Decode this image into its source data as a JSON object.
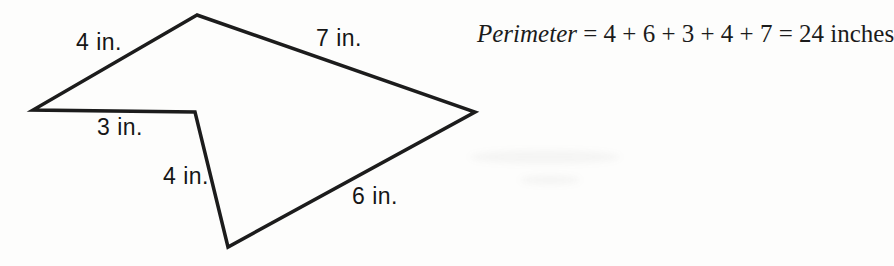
{
  "figure": {
    "shape": "irregular-pentagon",
    "points": "197,15 33,110 195,112 228,247 475,112",
    "stroke_color": "#1c1c1c",
    "stroke_width": "3.5",
    "labels": [
      {
        "text": "4 in."
      },
      {
        "text": "7 in."
      },
      {
        "text": "3 in."
      },
      {
        "text": "4 in."
      },
      {
        "text": "6 in."
      }
    ]
  },
  "equation": {
    "term": "Perimeter",
    "rest": " = 4 + 6 + 3 + 4 + 7 = 24 inches",
    "value": "24",
    "unit": "inches"
  }
}
